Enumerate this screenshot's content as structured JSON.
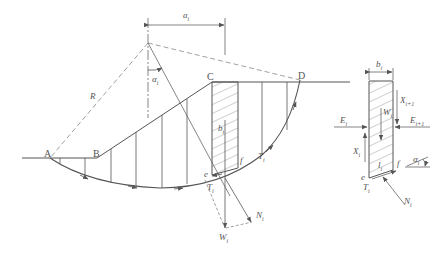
{
  "diagram": {
    "type": "slope-stability-method-of-slices",
    "colors": {
      "line": "#555555",
      "dashed": "#888888",
      "background": "#ffffff"
    },
    "points": {
      "A": "A",
      "B": "B",
      "C": "C",
      "D": "D",
      "e_main": "e",
      "f_main": "f",
      "e_fbd": "e",
      "f_fbd": "f"
    },
    "labels": {
      "radius": "R",
      "offset_dim": "a",
      "offset_sub": "i",
      "angle": "α",
      "angle_sub": "i",
      "slice_width": "b",
      "slice_width_sub": "i",
      "tangential_force_main": "T",
      "tangential_force_main_sub": "i",
      "tangential_force_mid": "T",
      "tangential_force_mid_sub": "i",
      "normal_force_main": "N",
      "normal_force_main_sub": "i",
      "weight_main": "W",
      "weight_main_sub": "i",
      "fbd_width": "b",
      "fbd_width_sub": "i",
      "fbd_weight": "W",
      "fbd_weight_sub": "i",
      "fbd_E_left": "E",
      "fbd_E_left_sub": "i",
      "fbd_E_right": "E",
      "fbd_E_right_sub": "i+1",
      "fbd_X_left": "X",
      "fbd_X_left_sub": "i",
      "fbd_X_right": "X",
      "fbd_X_right_sub": "i+1",
      "fbd_base_length": "l",
      "fbd_base_length_sub": "i",
      "fbd_T": "T",
      "fbd_T_sub": "i",
      "fbd_N": "N",
      "fbd_N_sub": "i",
      "fbd_alpha": "α",
      "fbd_alpha_sub": "i"
    }
  }
}
